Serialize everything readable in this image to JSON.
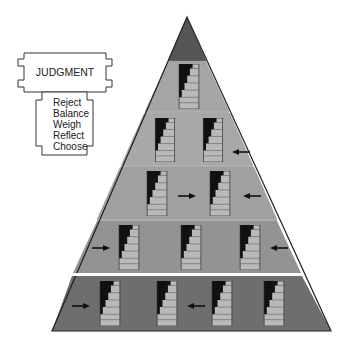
{
  "judgment_box": {
    "title": "JUDGMENT",
    "items": [
      "Reject",
      "Balance",
      "Weigh",
      "Reflect",
      "Choose"
    ]
  },
  "pyramid": {
    "apex": [
      187,
      17
    ],
    "base_y": 331,
    "base_left": 52,
    "base_right": 331,
    "band_dividers_y": [
      60,
      112,
      166,
      220,
      274
    ],
    "tiers": [
      {
        "name": "apex",
        "staircases": 0,
        "arrows": []
      },
      {
        "name": "tier-1",
        "staircases": 1,
        "arrows": []
      },
      {
        "name": "tier-2",
        "staircases": 2,
        "arrows": [
          "left-at-right-edge"
        ]
      },
      {
        "name": "tier-3",
        "staircases": 2,
        "arrows": [
          "right-between",
          "left-at-right-edge"
        ]
      },
      {
        "name": "tier-4",
        "staircases": 3,
        "arrows": [
          "right-at-left-edge",
          "left-at-right-edge"
        ]
      },
      {
        "name": "tier-5",
        "staircases": 4,
        "arrows": [
          "right-at-left-edge",
          "left-between-2-3"
        ]
      }
    ]
  },
  "colors": {
    "apex": "#555555",
    "tier_light": "#a8a8a8",
    "tier_mid": "#999999",
    "tier_dark": "#6e6e6e",
    "stair_light": "#b8b8b8",
    "stair_dark": "#111111",
    "outline": "#222222",
    "divider": "#ffffff"
  }
}
